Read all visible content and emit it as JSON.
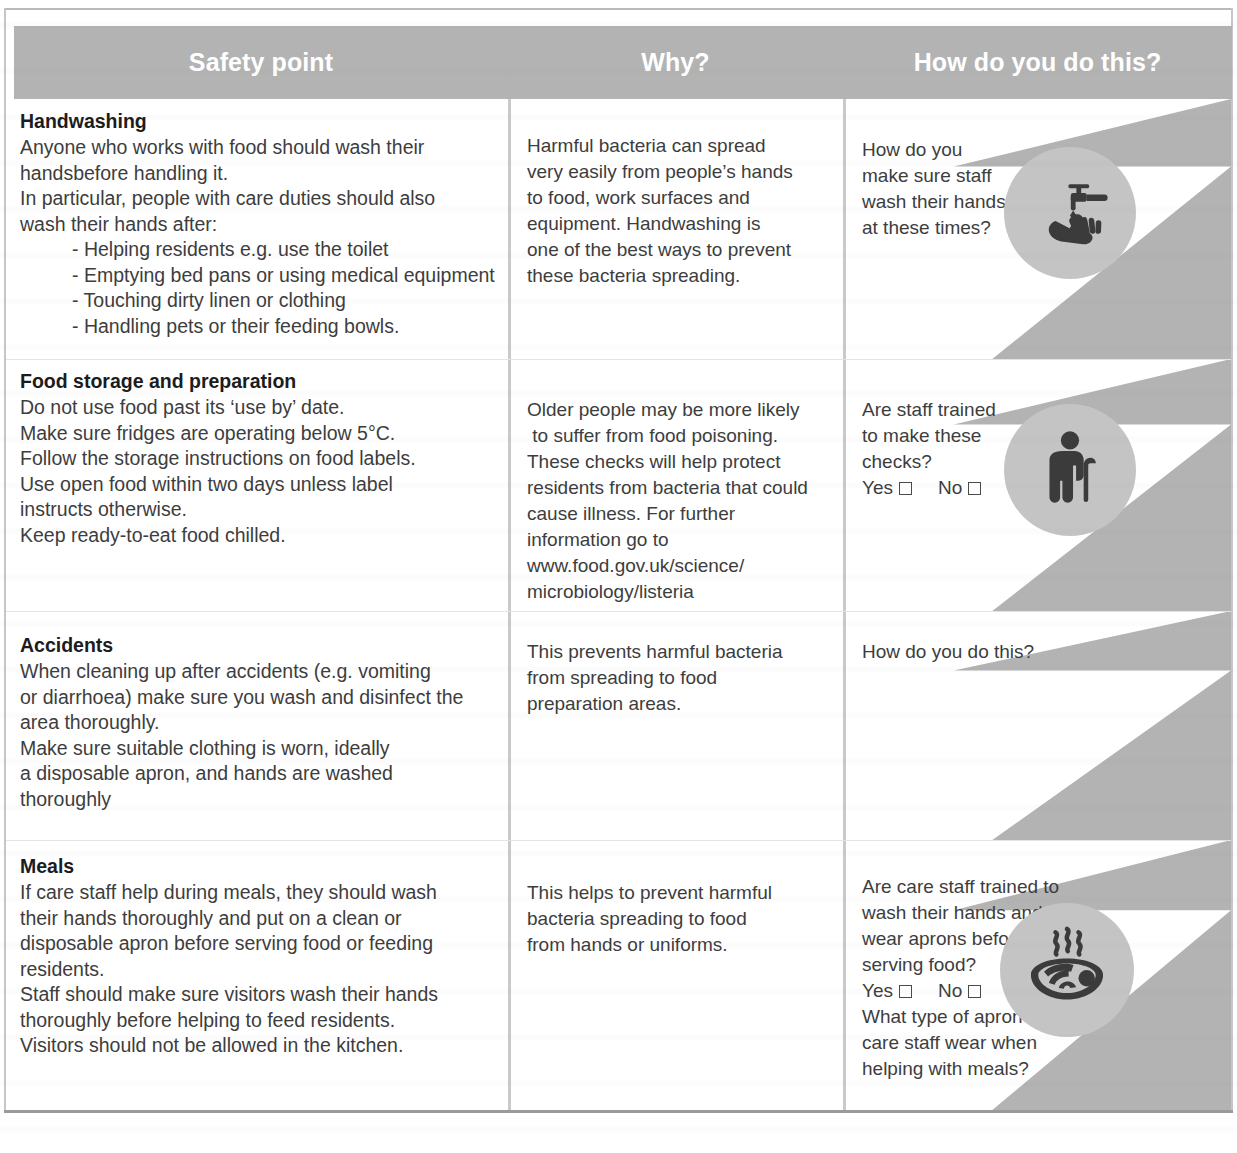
{
  "table": {
    "headers": [
      {
        "label": "Safety point"
      },
      {
        "label": "Why?"
      },
      {
        "label": "How do you do this?"
      }
    ],
    "colors": {
      "header_band": "#b3b3b3",
      "header_text": "#ffffff",
      "decoration": "#b3b3b3",
      "icon_badge": "#c4c4c4",
      "icon_glyph": "#3b3b3b",
      "divider": "#c9c9c9",
      "body_text": "#3d3d3d",
      "title_text": "#1c1c1c"
    },
    "rows": [
      {
        "id": "handwashing",
        "title": "Handwashing",
        "safety_lines": [
          {
            "text": "Anyone who works with food should wash their",
            "indent": false
          },
          {
            "text": "handsbefore handling it.",
            "indent": false
          },
          {
            "text": "In particular, people with care duties should also",
            "indent": false
          },
          {
            "text": "wash their hands after:",
            "indent": false
          },
          {
            "text": "- Helping residents e.g. use the toilet",
            "indent": true
          },
          {
            "text": "- Emptying bed pans or using medical equipment",
            "indent": true
          },
          {
            "text": "- Touching dirty linen or clothing",
            "indent": true
          },
          {
            "text": "- Handling pets or their feeding bowls.",
            "indent": true
          }
        ],
        "why_lines": [
          "Harmful bacteria can spread",
          "very easily from people’s hands",
          "to food, work surfaces and",
          "equipment. Handwashing is",
          "one of the best ways to prevent",
          "these bacteria spreading."
        ],
        "how_lines": [
          "How do you",
          "make sure staff",
          "wash their hands",
          "at these times?"
        ],
        "checkboxes": null,
        "how_lines_after": [],
        "icon": "tap-handwash-icon"
      },
      {
        "id": "food-storage-and-preparation",
        "title": "Food storage and preparation",
        "safety_lines": [
          {
            "text": "Do not use food past its ‘use by’ date.",
            "indent": false
          },
          {
            "text": "Make sure fridges are operating below 5°C.",
            "indent": false
          },
          {
            "text": "Follow the storage instructions on food labels.",
            "indent": false
          },
          {
            "text": "Use open food within two days unless label",
            "indent": false
          },
          {
            "text": "instructs otherwise.",
            "indent": false
          },
          {
            "text": "Keep ready-to-eat food chilled.",
            "indent": false
          }
        ],
        "why_lines": [
          "Older people may be more likely",
          " to suffer from food poisoning.",
          "These checks will help protect",
          "residents from bacteria that could",
          "cause illness. For further",
          "information go to",
          "www.food.gov.uk/science/",
          "microbiology/listeria"
        ],
        "how_lines": [
          "Are staff trained",
          "to make these",
          "checks?"
        ],
        "checkboxes": {
          "yes_label": "Yes",
          "no_label": "No"
        },
        "how_lines_after": [],
        "icon": "elderly-person-with-cane-icon"
      },
      {
        "id": "accidents",
        "title": "Accidents",
        "safety_lines": [
          {
            "text": "When cleaning up after accidents (e.g. vomiting",
            "indent": false
          },
          {
            "text": "or diarrhoea) make sure you wash and disinfect the",
            "indent": false
          },
          {
            "text": "area thoroughly.",
            "indent": false
          },
          {
            "text": "Make sure suitable clothing is worn, ideally",
            "indent": false
          },
          {
            "text": "a disposable apron, and hands are washed",
            "indent": false
          },
          {
            "text": "thoroughly",
            "indent": false
          }
        ],
        "why_lines": [
          "This prevents harmful bacteria",
          "from spreading to food",
          "preparation areas."
        ],
        "how_lines": [
          "How do you do this?"
        ],
        "checkboxes": null,
        "how_lines_after": [],
        "icon": null
      },
      {
        "id": "meals",
        "title": "Meals",
        "safety_lines": [
          {
            "text": "If care staff help during meals, they should wash",
            "indent": false
          },
          {
            "text": "their hands thoroughly and put on a clean or",
            "indent": false
          },
          {
            "text": "disposable apron before serving food or feeding",
            "indent": false
          },
          {
            "text": "residents.",
            "indent": false
          },
          {
            "text": "Staff should make sure visitors wash their hands",
            "indent": false
          },
          {
            "text": "thoroughly before helping to feed residents.",
            "indent": false
          },
          {
            "text": "Visitors should not be allowed in the kitchen.",
            "indent": false
          }
        ],
        "why_lines": [
          "This helps to prevent harmful",
          "bacteria spreading to food",
          "from hands or uniforms."
        ],
        "how_lines": [
          "Are care staff trained to",
          "wash their hands and",
          "wear aprons before",
          "serving food?"
        ],
        "checkboxes": {
          "yes_label": "Yes",
          "no_label": "No"
        },
        "how_lines_after": [
          "What type of apron do",
          "care staff wear when",
          "helping with meals?"
        ],
        "icon": "steaming-meal-bowl-icon"
      }
    ]
  }
}
